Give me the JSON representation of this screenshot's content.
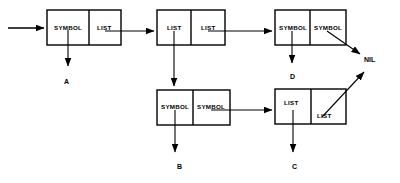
{
  "diagram": {
    "stroke_color": "#000000",
    "fill_color": "#ffffff",
    "boxes": [
      {
        "id": "box1",
        "x": 47,
        "y": 10,
        "w": 74,
        "h": 35,
        "left_cell": "SYMBOL",
        "right_cell": "LIST"
      },
      {
        "id": "box2",
        "x": 157,
        "y": 10,
        "w": 68,
        "h": 35,
        "left_cell": "LIST",
        "right_cell": "LIST"
      },
      {
        "id": "box3",
        "x": 275,
        "y": 10,
        "w": 71,
        "h": 35,
        "left_cell": "SYMBOL",
        "right_cell": "SYMBOL"
      },
      {
        "id": "box4",
        "x": 157,
        "y": 90,
        "w": 73,
        "h": 35,
        "left_cell": "SYMBOL",
        "right_cell": "SYMBOL"
      },
      {
        "id": "box5",
        "x": 275,
        "y": 89,
        "w": 71,
        "h": 35,
        "left_cell": "LIST",
        "right_cell": "LIST"
      }
    ],
    "labels": [
      {
        "id": "label-a",
        "text": "A",
        "x": 64,
        "y": 78
      },
      {
        "id": "label-b",
        "text": "B",
        "x": 177,
        "y": 163
      },
      {
        "id": "label-c",
        "text": "C",
        "x": 292,
        "y": 163
      },
      {
        "id": "label-d",
        "text": "D",
        "x": 290,
        "y": 73
      },
      {
        "id": "label-nil",
        "text": "NIL",
        "x": 364,
        "y": 56
      }
    ]
  }
}
